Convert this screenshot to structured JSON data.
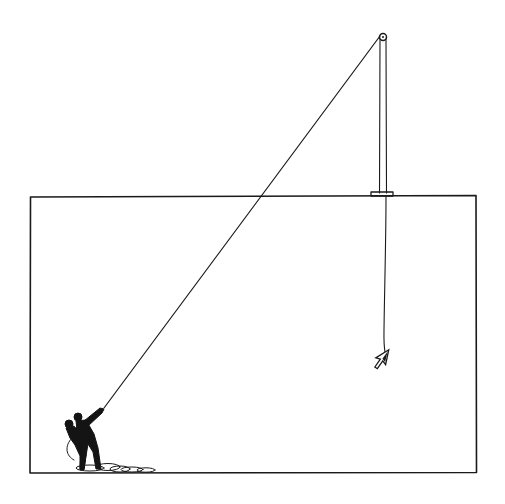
{
  "illustration": {
    "description": "Pen-and-ink drawing: two men at the lower left of a large rectangular frame haul a rope over a pulley mounted high above the frame; the rope passes through a small block on the frame's top edge and lowers a mouse-cursor arrow into the frame.",
    "style": "black line art on white",
    "colors": {
      "ink": "#1a1a1a",
      "background": "#ffffff"
    },
    "elements": {
      "frame": {
        "x": 30,
        "y": 196,
        "width": 446,
        "height": 277
      },
      "pulley": {
        "cx": 383,
        "cy": 37,
        "r": 3.5
      },
      "rope_block": {
        "x": 371,
        "y": 192,
        "width": 22,
        "height": 4
      },
      "cursor_arrow": {
        "x": 382,
        "y": 358,
        "label": "cursor-arrow"
      },
      "figures": {
        "count": 2,
        "x": 80,
        "y": 440,
        "pose": "hauling rope"
      },
      "rope_coil": {
        "x": 110,
        "y": 466
      }
    }
  }
}
